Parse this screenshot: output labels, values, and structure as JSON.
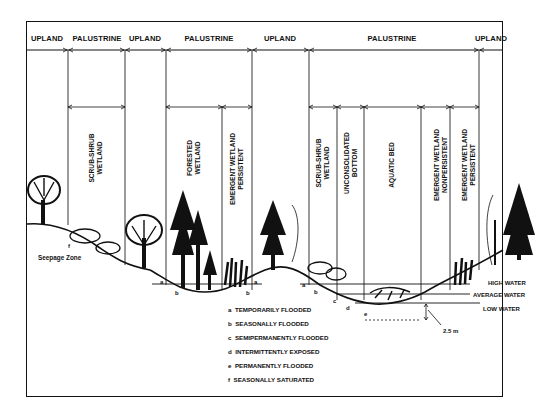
{
  "diagram": {
    "header_zones": [
      {
        "label": "UPLAND",
        "x": 47
      },
      {
        "label": "PALUSTRINE",
        "x": 97
      },
      {
        "label": "UPLAND",
        "x": 145
      },
      {
        "label": "PALUSTRINE",
        "x": 209
      },
      {
        "label": "UPLAND",
        "x": 280
      },
      {
        "label": "PALUSTRINE",
        "x": 392
      },
      {
        "label": "UPLAND",
        "x": 491
      }
    ],
    "wetland_classes": [
      {
        "line1": "SCRUB-SHRUB",
        "line2": "WETLAND"
      },
      {
        "line1": "FORESTED",
        "line2": "WETLAND"
      },
      {
        "line1": "EMERGENT WETLAND",
        "line2": "PERSISTENT"
      },
      {
        "line1": "SCRUB-SHRUB",
        "line2": "WETLAND"
      },
      {
        "line1": "UNCONSOLIDATED",
        "line2": "BOTTOM"
      },
      {
        "line1": "AQUATIC BED",
        "line2": ""
      },
      {
        "line1": "EMERGENT WETLAND",
        "line2": "NONPERSISTENT"
      },
      {
        "line1": "EMERGENT WETLAND",
        "line2": "PERSISTENT"
      }
    ],
    "annotations": {
      "seepage_zone": "Seepage Zone",
      "f_marker": "f",
      "high_water": "HIGH WATER",
      "average_water": "AVERAGE WATER",
      "low_water": "LOW WATER",
      "depth": "2.5 m",
      "markers": {
        "a": "a",
        "b": "b",
        "c": "c",
        "d": "d",
        "e": "e"
      }
    },
    "legend": [
      {
        "key": "a",
        "text": "TEMPORARILY FLOODED"
      },
      {
        "key": "b",
        "text": "SEASONALLY FLOODED"
      },
      {
        "key": "c",
        "text": "SEMIPERMANENTLY FLOODED"
      },
      {
        "key": "d",
        "text": "INTERMITTENTLY EXPOSED"
      },
      {
        "key": "e",
        "text": "PERMANENTLY FLOODED"
      },
      {
        "key": "f",
        "text": "SEASONALLY SATURATED"
      }
    ]
  }
}
